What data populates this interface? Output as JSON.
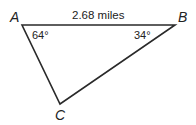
{
  "diagram": {
    "type": "triangle",
    "vertices": [
      {
        "label": "A",
        "x": 22,
        "y": 25
      },
      {
        "label": "B",
        "x": 175,
        "y": 25
      },
      {
        "label": "C",
        "x": 60,
        "y": 104
      }
    ],
    "side_label": "2.68 miles",
    "angles": {
      "A": "64°",
      "B": "34°"
    },
    "stroke_color": "#2a2a2a"
  }
}
